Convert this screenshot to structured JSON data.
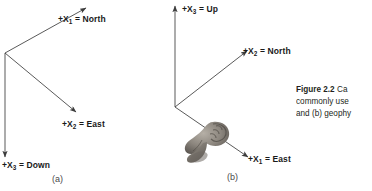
{
  "figure": {
    "caption_lines": [
      {
        "strong": "Figure 2.2",
        "rest": "  Ca"
      },
      {
        "strong": "",
        "rest": "commonly use"
      },
      {
        "strong": "",
        "rest": "and (b) geophy"
      }
    ],
    "caption_full_visible": "Figure 2.2  Ca commonly use and (b) geophy"
  },
  "panel_a": {
    "caption": "(a)",
    "axes": [
      {
        "name": "x1-north",
        "sign": "+",
        "symbol": "X",
        "subscript": "1",
        "equals": " = ",
        "value": "North",
        "label": "+X1 = North"
      },
      {
        "name": "x2-east",
        "sign": "+",
        "symbol": "X",
        "subscript": "2",
        "equals": " = ",
        "value": "East",
        "label": "+X2 = East"
      },
      {
        "name": "x3-down",
        "sign": "+",
        "symbol": "X",
        "subscript": "3",
        "equals": " = ",
        "value": "Down",
        "label": "+X3 = Down"
      }
    ]
  },
  "panel_b": {
    "caption": "(b)",
    "axes": [
      {
        "name": "x3-up",
        "sign": "+",
        "symbol": "X",
        "subscript": "3",
        "equals": " = ",
        "value": "Up",
        "label": "+X3 = Up"
      },
      {
        "name": "x2-north",
        "sign": "+",
        "symbol": "X",
        "subscript": "2",
        "equals": " = ",
        "value": "North",
        "label": "+X2 = North"
      },
      {
        "name": "x1-east",
        "sign": "+",
        "symbol": "X",
        "subscript": "1",
        "equals": " = ",
        "value": "East",
        "label": "+X1 = East"
      }
    ]
  },
  "colors": {
    "background": "#ffffff",
    "line": "#3c3c3c",
    "label_text": "#1a1a1a",
    "panel_caption_text": "#4a4a4a",
    "caption_text": "#231f20",
    "hand_dark": "#5a5550",
    "hand_mid": "#8c867e",
    "hand_light": "#b5afa6"
  }
}
